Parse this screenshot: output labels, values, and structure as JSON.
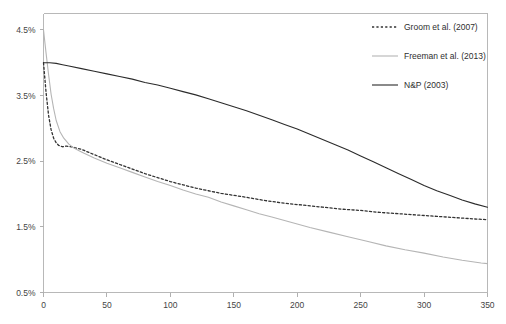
{
  "chart_data": {
    "type": "line",
    "title": "",
    "xlabel": "",
    "ylabel": "",
    "xlim": [
      0,
      350
    ],
    "ylim": [
      0.5,
      4.75
    ],
    "grid": false,
    "legend_position": "top-right",
    "x_ticks": [
      "0",
      "50",
      "100",
      "150",
      "200",
      "250",
      "300",
      "350"
    ],
    "x_tick_values": [
      0,
      50,
      100,
      150,
      200,
      250,
      300,
      350
    ],
    "y_ticks": [
      "0.5%",
      "1.5%",
      "2.5%",
      "3.5%",
      "4.5%"
    ],
    "y_tick_values": [
      0.5,
      1.5,
      2.5,
      3.5,
      4.5
    ],
    "series": [
      {
        "name": "Groom et al. (2007)",
        "style": "dashed",
        "color": "#333333",
        "x": [
          0,
          2,
          4,
          6,
          8,
          10,
          12,
          15,
          18,
          22,
          26,
          30,
          40,
          50,
          60,
          70,
          80,
          90,
          100,
          110,
          120,
          130,
          140,
          150,
          160,
          175,
          190,
          205,
          220,
          235,
          250,
          265,
          280,
          295,
          310,
          325,
          340,
          350
        ],
        "values": [
          4.0,
          3.55,
          3.2,
          2.98,
          2.85,
          2.78,
          2.74,
          2.72,
          2.73,
          2.72,
          2.7,
          2.68,
          2.6,
          2.52,
          2.45,
          2.38,
          2.31,
          2.25,
          2.19,
          2.14,
          2.09,
          2.05,
          2.01,
          1.98,
          1.95,
          1.9,
          1.86,
          1.83,
          1.8,
          1.77,
          1.75,
          1.72,
          1.7,
          1.68,
          1.66,
          1.64,
          1.62,
          1.61
        ]
      },
      {
        "name": "Freeman et al. (2013)",
        "style": "solid",
        "color": "#b5b5b5",
        "x": [
          0,
          2,
          4,
          6,
          8,
          10,
          13,
          16,
          20,
          24,
          28,
          32,
          40,
          50,
          60,
          70,
          80,
          90,
          100,
          110,
          120,
          130,
          140,
          150,
          160,
          170,
          180,
          195,
          210,
          225,
          240,
          255,
          270,
          285,
          300,
          315,
          330,
          345,
          350
        ],
        "values": [
          4.5,
          4.15,
          3.82,
          3.52,
          3.3,
          3.12,
          2.95,
          2.85,
          2.76,
          2.7,
          2.66,
          2.62,
          2.55,
          2.47,
          2.4,
          2.33,
          2.26,
          2.19,
          2.13,
          2.06,
          2.0,
          1.95,
          1.88,
          1.82,
          1.76,
          1.7,
          1.65,
          1.57,
          1.49,
          1.42,
          1.35,
          1.28,
          1.21,
          1.15,
          1.1,
          1.04,
          0.99,
          0.95,
          0.94
        ]
      },
      {
        "name": "N&P (2003)",
        "style": "solid",
        "color": "#2b2b2b",
        "x": [
          0,
          5,
          10,
          15,
          20,
          30,
          40,
          50,
          60,
          70,
          80,
          90,
          100,
          110,
          120,
          130,
          140,
          150,
          160,
          170,
          180,
          190,
          200,
          210,
          220,
          230,
          240,
          250,
          260,
          270,
          280,
          290,
          300,
          310,
          320,
          330,
          340,
          350
        ],
        "values": [
          4.0,
          4.0,
          3.99,
          3.97,
          3.95,
          3.91,
          3.87,
          3.83,
          3.79,
          3.75,
          3.7,
          3.66,
          3.61,
          3.56,
          3.51,
          3.45,
          3.39,
          3.33,
          3.27,
          3.2,
          3.13,
          3.06,
          2.99,
          2.91,
          2.83,
          2.75,
          2.67,
          2.58,
          2.49,
          2.4,
          2.31,
          2.22,
          2.13,
          2.05,
          1.98,
          1.91,
          1.85,
          1.8
        ]
      }
    ],
    "legend": [
      {
        "label": "Groom et al. (2007)",
        "style": "dashed",
        "color": "#333333"
      },
      {
        "label": "Freeman et al. (2013)",
        "style": "solid",
        "color": "#b5b5b5"
      },
      {
        "label": "N&P (2003)",
        "style": "solid",
        "color": "#2b2b2b"
      }
    ]
  }
}
